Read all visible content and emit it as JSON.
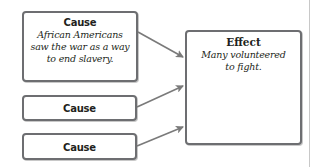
{
  "diagram": {
    "type": "cause-and-effect organizer",
    "causes": [
      {
        "title": "Cause",
        "text": "African Americans saw the war as a way to end slavery.",
        "lines": [
          "African Americans",
          "saw the war as a way",
          "to end slavery."
        ]
      },
      {
        "title": "Cause",
        "text": ""
      },
      {
        "title": "Cause",
        "text": ""
      }
    ],
    "effect": {
      "title": "Effect",
      "text": "Many volunteered to fight.",
      "lines": [
        "Many volunteered",
        "to fight."
      ]
    },
    "connectors": [
      {
        "from": "cause-1",
        "to": "effect",
        "icon": "arrow-right-icon"
      },
      {
        "from": "cause-2",
        "to": "effect",
        "icon": "arrow-right-icon"
      },
      {
        "from": "cause-3",
        "to": "effect",
        "icon": "arrow-right-icon"
      }
    ],
    "colors": {
      "border": "#6d6e71",
      "arrow": "#7a7a7a",
      "text": "#231f20",
      "divider": "#c8c8c8"
    }
  }
}
